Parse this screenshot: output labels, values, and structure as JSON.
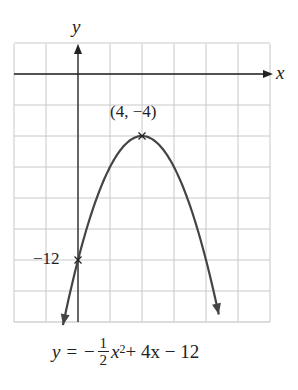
{
  "chart_data": {
    "type": "line",
    "title": "",
    "xlabel": "x",
    "ylabel": "y",
    "equation": "y = -1/2 x^2 + 4x - 12",
    "function": {
      "a": -0.5,
      "b": 4,
      "c": -12
    },
    "xlim": [
      -4,
      12
    ],
    "ylim": [
      -18,
      2
    ],
    "grid": true,
    "grid_step": {
      "x": 2,
      "y": 2
    },
    "annotations": [
      {
        "label": "(4, −4)",
        "x": 4,
        "y": -4,
        "type": "vertex"
      },
      {
        "label": "−12",
        "x": 0,
        "y": -12,
        "type": "y-intercept"
      }
    ],
    "curve_x_range": [
      -0.94,
      8.8
    ],
    "series": [
      {
        "name": "parabola",
        "x": [
          -0.94,
          0,
          2,
          4,
          6,
          8,
          8.8
        ],
        "y": [
          -16.2,
          -12,
          -6,
          -4,
          -6,
          -12,
          -15.52
        ]
      }
    ]
  },
  "labels": {
    "x_axis": "x",
    "y_axis": "y",
    "vertex": "(4, −4)",
    "intercept": "−12",
    "eq_lhs": "y = −",
    "eq_num": "1",
    "eq_den": "2",
    "eq_x": "x",
    "eq_exp": "2",
    "eq_rest": " + 4x − 12"
  },
  "colors": {
    "grid": "#c8c8c8",
    "axis": "#222222",
    "curve": "#444444"
  }
}
